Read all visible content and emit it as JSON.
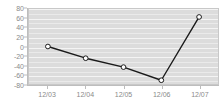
{
  "chart_data": {
    "type": "line",
    "title": "",
    "xlabel": "",
    "ylabel": "",
    "categories": [
      "12/03",
      "12/04",
      "12/05",
      "12/06",
      "12/07"
    ],
    "values": [
      0,
      -25,
      -44,
      -72,
      63
    ],
    "series": [
      {
        "name": "",
        "values": [
          0,
          -25,
          -44,
          -72,
          63
        ]
      }
    ],
    "ylim": [
      -80,
      80
    ],
    "y_ticks": [
      "80",
      "60",
      "40",
      "20",
      "0",
      "-20",
      "-40",
      "-60",
      "-80"
    ],
    "y_tick_values": [
      80,
      60,
      40,
      20,
      0,
      -20,
      -40,
      -60,
      -80
    ],
    "x_ticks": [
      "12/03",
      "12/04",
      "12/05",
      "12/06",
      "12/07"
    ],
    "grid": true,
    "legend": false,
    "legend_position": "none",
    "colors": {
      "line": "#1a1a1a",
      "marker_fill": "#ffffff",
      "marker_stroke": "#1a1a1a",
      "plot_background": "#dcdcdc",
      "gridline": "#f4f4f4",
      "axis": "#bdbdbd",
      "tick_label": "#8a8a8a",
      "page_background": "#ffffff"
    }
  }
}
